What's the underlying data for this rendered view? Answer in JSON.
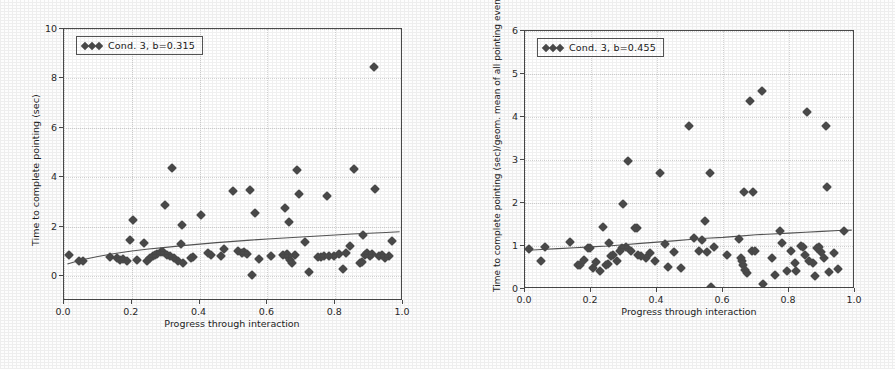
{
  "figure": {
    "background": "#fdfdfd",
    "marker_color": "#4b4b4b",
    "line_color": "#555555",
    "grid_color": "#d8d8d8"
  },
  "chart_data": [
    {
      "type": "scatter",
      "panel": "left",
      "title": "",
      "xlabel": "Progress through interaction",
      "ylabel": "Time to complete pointing (sec)",
      "xlim": [
        0.0,
        1.0
      ],
      "ylim": [
        -1.0,
        10.0
      ],
      "xticks": [
        "0.0",
        "0.2",
        "0.4",
        "0.6",
        "0.8",
        "1.0"
      ],
      "xtickvalues": [
        0.0,
        0.2,
        0.4,
        0.6,
        0.8,
        1.0
      ],
      "yticks": [
        "0",
        "2",
        "4",
        "6",
        "8",
        "10"
      ],
      "ytickvalues": [
        0,
        2,
        4,
        6,
        8,
        10
      ],
      "grid": true,
      "legend": {
        "position": "upper left",
        "entries": [
          {
            "label": "Cond. 3, b=0.315",
            "marker": "diamond"
          }
        ]
      },
      "fit_line": {
        "label": "b=0.315",
        "points": [
          [
            0.01,
            0.5
          ],
          [
            0.05,
            0.66
          ],
          [
            0.1,
            0.8
          ],
          [
            0.15,
            0.92
          ],
          [
            0.2,
            1.02
          ],
          [
            0.25,
            1.1
          ],
          [
            0.3,
            1.17
          ],
          [
            0.35,
            1.24
          ],
          [
            0.4,
            1.3
          ],
          [
            0.45,
            1.36
          ],
          [
            0.5,
            1.41
          ],
          [
            0.55,
            1.46
          ],
          [
            0.6,
            1.51
          ],
          [
            0.65,
            1.55
          ],
          [
            0.7,
            1.59
          ],
          [
            0.75,
            1.63
          ],
          [
            0.8,
            1.67
          ],
          [
            0.85,
            1.71
          ],
          [
            0.9,
            1.74
          ],
          [
            0.95,
            1.77
          ],
          [
            0.99,
            1.8
          ]
        ]
      },
      "points": [
        [
          0.015,
          0.85
        ],
        [
          0.045,
          0.62
        ],
        [
          0.055,
          0.63
        ],
        [
          0.135,
          0.78
        ],
        [
          0.155,
          0.72
        ],
        [
          0.165,
          0.64
        ],
        [
          0.175,
          0.7
        ],
        [
          0.185,
          0.62
        ],
        [
          0.195,
          1.46
        ],
        [
          0.205,
          2.27
        ],
        [
          0.215,
          0.66
        ],
        [
          0.235,
          1.33
        ],
        [
          0.245,
          0.62
        ],
        [
          0.255,
          0.74
        ],
        [
          0.262,
          0.8
        ],
        [
          0.268,
          0.86
        ],
        [
          0.275,
          0.92
        ],
        [
          0.285,
          0.98
        ],
        [
          0.292,
          1.0
        ],
        [
          0.298,
          2.88
        ],
        [
          0.305,
          0.88
        ],
        [
          0.312,
          0.8
        ],
        [
          0.318,
          4.37
        ],
        [
          0.325,
          0.73
        ],
        [
          0.335,
          0.62
        ],
        [
          0.345,
          1.31
        ],
        [
          0.348,
          2.08
        ],
        [
          0.352,
          0.55
        ],
        [
          0.375,
          0.73
        ],
        [
          0.382,
          0.76
        ],
        [
          0.405,
          2.46
        ],
        [
          0.425,
          0.93
        ],
        [
          0.435,
          0.88
        ],
        [
          0.462,
          0.82
        ],
        [
          0.472,
          1.12
        ],
        [
          0.498,
          3.45
        ],
        [
          0.512,
          1.02
        ],
        [
          0.525,
          0.96
        ],
        [
          0.532,
          1.0
        ],
        [
          0.54,
          0.92
        ],
        [
          0.548,
          3.5
        ],
        [
          0.555,
          0.06
        ],
        [
          0.562,
          2.55
        ],
        [
          0.575,
          0.7
        ],
        [
          0.612,
          0.8
        ],
        [
          0.645,
          0.86
        ],
        [
          0.652,
          2.77
        ],
        [
          0.658,
          0.9
        ],
        [
          0.662,
          0.78
        ],
        [
          0.665,
          2.18
        ],
        [
          0.668,
          0.64
        ],
        [
          0.672,
          0.55
        ],
        [
          0.682,
          0.86
        ],
        [
          0.688,
          4.3
        ],
        [
          0.692,
          3.33
        ],
        [
          0.712,
          1.38
        ],
        [
          0.722,
          0.16
        ],
        [
          0.748,
          0.76
        ],
        [
          0.758,
          0.78
        ],
        [
          0.768,
          0.8
        ],
        [
          0.775,
          3.24
        ],
        [
          0.782,
          0.8
        ],
        [
          0.795,
          0.84
        ],
        [
          0.812,
          0.92
        ],
        [
          0.822,
          0.3
        ],
        [
          0.832,
          0.96
        ],
        [
          0.845,
          1.22
        ],
        [
          0.855,
          4.32
        ],
        [
          0.872,
          0.54
        ],
        [
          0.878,
          0.58
        ],
        [
          0.882,
          1.68
        ],
        [
          0.888,
          0.88
        ],
        [
          0.895,
          0.96
        ],
        [
          0.902,
          0.84
        ],
        [
          0.908,
          0.92
        ],
        [
          0.915,
          8.45
        ],
        [
          0.918,
          3.54
        ],
        [
          0.928,
          0.8
        ],
        [
          0.938,
          0.86
        ],
        [
          0.948,
          0.72
        ],
        [
          0.958,
          0.82
        ],
        [
          0.968,
          1.44
        ]
      ]
    },
    {
      "type": "scatter",
      "panel": "right",
      "title": "",
      "xlabel": "Progress through interaction",
      "ylabel": "Time to complete pointing (sec)/geom. mean of all pointing events",
      "xlim": [
        0.0,
        1.0
      ],
      "ylim": [
        0.0,
        6.0
      ],
      "xticks": [
        "0.0",
        "0.2",
        "0.4",
        "0.6",
        "0.8",
        "1.0"
      ],
      "xtickvalues": [
        0.0,
        0.2,
        0.4,
        0.6,
        0.8,
        1.0
      ],
      "yticks": [
        "0",
        "1",
        "2",
        "3",
        "4",
        "5",
        "6"
      ],
      "ytickvalues": [
        0,
        1,
        2,
        3,
        4,
        5,
        6
      ],
      "grid": true,
      "legend": {
        "position": "upper left",
        "entries": [
          {
            "label": "Cond. 3, b=0.455",
            "marker": "diamond"
          }
        ]
      },
      "fit_line": {
        "label": "b=0.455",
        "points": [
          [
            0.01,
            0.9
          ],
          [
            0.05,
            0.92
          ],
          [
            0.1,
            0.94
          ],
          [
            0.15,
            0.96
          ],
          [
            0.2,
            0.98
          ],
          [
            0.25,
            1.0
          ],
          [
            0.3,
            1.03
          ],
          [
            0.35,
            1.06
          ],
          [
            0.4,
            1.09
          ],
          [
            0.45,
            1.12
          ],
          [
            0.5,
            1.15
          ],
          [
            0.55,
            1.18
          ],
          [
            0.6,
            1.2
          ],
          [
            0.65,
            1.23
          ],
          [
            0.7,
            1.26
          ],
          [
            0.75,
            1.28
          ],
          [
            0.8,
            1.3
          ],
          [
            0.85,
            1.32
          ],
          [
            0.9,
            1.34
          ],
          [
            0.95,
            1.36
          ],
          [
            0.99,
            1.37
          ]
        ]
      },
      "points": [
        [
          0.012,
          0.92
        ],
        [
          0.048,
          0.64
        ],
        [
          0.062,
          0.97
        ],
        [
          0.135,
          1.09
        ],
        [
          0.162,
          0.56
        ],
        [
          0.168,
          0.55
        ],
        [
          0.178,
          0.68
        ],
        [
          0.192,
          0.95
        ],
        [
          0.198,
          0.96
        ],
        [
          0.205,
          0.49
        ],
        [
          0.215,
          0.62
        ],
        [
          0.228,
          0.42
        ],
        [
          0.235,
          1.45
        ],
        [
          0.245,
          0.56
        ],
        [
          0.252,
          0.58
        ],
        [
          0.255,
          1.08
        ],
        [
          0.262,
          0.76
        ],
        [
          0.268,
          0.8
        ],
        [
          0.278,
          0.66
        ],
        [
          0.288,
          0.88
        ],
        [
          0.295,
          0.95
        ],
        [
          0.298,
          1.97
        ],
        [
          0.305,
          0.98
        ],
        [
          0.312,
          2.97
        ],
        [
          0.322,
          0.88
        ],
        [
          0.332,
          1.41
        ],
        [
          0.338,
          1.42
        ],
        [
          0.342,
          0.78
        ],
        [
          0.352,
          0.76
        ],
        [
          0.368,
          0.72
        ],
        [
          0.378,
          0.84
        ],
        [
          0.395,
          0.66
        ],
        [
          0.408,
          2.7
        ],
        [
          0.425,
          1.04
        ],
        [
          0.432,
          0.51
        ],
        [
          0.452,
          0.86
        ],
        [
          0.472,
          0.5
        ],
        [
          0.498,
          3.79
        ],
        [
          0.512,
          1.18
        ],
        [
          0.528,
          0.88
        ],
        [
          0.535,
          1.14
        ],
        [
          0.545,
          1.58
        ],
        [
          0.552,
          0.86
        ],
        [
          0.562,
          2.7
        ],
        [
          0.565,
          0.04
        ],
        [
          0.572,
          0.98
        ],
        [
          0.612,
          0.78
        ],
        [
          0.648,
          1.17
        ],
        [
          0.655,
          0.72
        ],
        [
          0.658,
          0.64
        ],
        [
          0.662,
          0.55
        ],
        [
          0.665,
          2.25
        ],
        [
          0.668,
          0.44
        ],
        [
          0.672,
          0.38
        ],
        [
          0.682,
          4.37
        ],
        [
          0.688,
          0.89
        ],
        [
          0.692,
          2.25
        ],
        [
          0.698,
          0.88
        ],
        [
          0.718,
          4.61
        ],
        [
          0.722,
          0.12
        ],
        [
          0.748,
          0.71
        ],
        [
          0.758,
          0.33
        ],
        [
          0.772,
          1.36
        ],
        [
          0.778,
          1.06
        ],
        [
          0.795,
          0.41
        ],
        [
          0.805,
          0.89
        ],
        [
          0.818,
          0.6
        ],
        [
          0.822,
          0.42
        ],
        [
          0.835,
          1.0
        ],
        [
          0.842,
          0.98
        ],
        [
          0.848,
          0.78
        ],
        [
          0.855,
          4.12
        ],
        [
          0.862,
          0.64
        ],
        [
          0.872,
          0.61
        ],
        [
          0.878,
          0.31
        ],
        [
          0.885,
          0.96
        ],
        [
          0.892,
          0.98
        ],
        [
          0.898,
          0.86
        ],
        [
          0.905,
          0.72
        ],
        [
          0.912,
          3.8
        ],
        [
          0.915,
          2.38
        ],
        [
          0.922,
          0.4
        ],
        [
          0.935,
          0.84
        ],
        [
          0.948,
          0.46
        ],
        [
          0.968,
          1.35
        ]
      ]
    }
  ]
}
